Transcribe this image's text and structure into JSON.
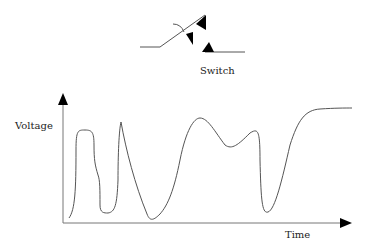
{
  "switch": {
    "label": "Switch"
  },
  "axes": {
    "ylabel": "Voltage",
    "xlabel": "Time"
  },
  "colors": {
    "line": "#555555",
    "arrow": "#000000",
    "text": "#222222"
  }
}
